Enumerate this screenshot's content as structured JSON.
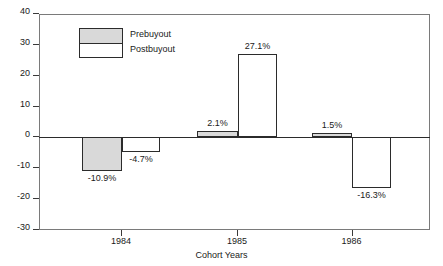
{
  "chart_data": {
    "type": "bar",
    "title": "",
    "xlabel": "Cohort Years",
    "ylabel": "",
    "categories": [
      "1984",
      "1985",
      "1986"
    ],
    "series": [
      {
        "name": "Prebuyout",
        "values": [
          -10.9,
          2.1,
          1.5
        ],
        "labels": [
          "-10.9%",
          "2.1%",
          "1.5%"
        ],
        "fill": "#d9d9d9"
      },
      {
        "name": "Postbuyout",
        "values": [
          -4.7,
          27.1,
          -16.3
        ],
        "labels": [
          "-4.7%",
          "27.1%",
          "-16.3%"
        ],
        "fill": "#ffffff"
      }
    ],
    "ylim": [
      -30,
      40
    ],
    "yticks": [
      40,
      30,
      20,
      10,
      0,
      -10,
      -20,
      -30
    ],
    "ytick_labels": [
      "40",
      "30",
      "20",
      "10",
      "0",
      "-10",
      "-20",
      "-30"
    ],
    "grid": false,
    "legend_position": "upper-left",
    "axis_color": "#2b2b2b",
    "frame_color": "#7a7a7a"
  },
  "legend": {
    "items": [
      {
        "label": "Prebuyout"
      },
      {
        "label": "Postbuyout"
      }
    ]
  }
}
